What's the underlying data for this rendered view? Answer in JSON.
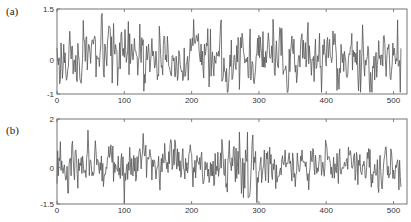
{
  "chart_data": [
    {
      "type": "line",
      "panel_label": "(a)",
      "title": "",
      "xlabel": "",
      "ylabel": "",
      "xlim": [
        0,
        520
      ],
      "ylim": [
        -1,
        1.5
      ],
      "xticks": [
        0,
        100,
        200,
        300,
        400,
        500
      ],
      "xtick_labels": [
        "0",
        "100",
        "200",
        "300",
        "400",
        "500"
      ],
      "yticks": [
        -1,
        0,
        1.5
      ],
      "ytick_labels": [
        "-1",
        "0",
        "1.5"
      ],
      "grid": false,
      "legend": null,
      "series": [
        {
          "name": "signal a",
          "n_points": 512,
          "color": "#555555",
          "description": "zero-mean noise-like trace, mostly within -0.6..1.0, occasional spikes to ~1.2 and dips to ~-0.8",
          "amplitude": 0.42,
          "seed": 17,
          "sample_values": {
            "x": [
              0,
              15,
              60,
              100,
              150,
              170,
              180,
              200,
              250,
              270,
              300,
              350,
              400,
              450,
              500
            ],
            "y": [
              0.1,
              0.9,
              -0.6,
              0.3,
              -0.5,
              1.1,
              -0.9,
              0.8,
              -0.5,
              -0.6,
              0.5,
              1.1,
              0.3,
              0.9,
              0.1
            ]
          }
        }
      ]
    },
    {
      "type": "line",
      "panel_label": "(b)",
      "title": "",
      "xlabel": "",
      "ylabel": "",
      "xlim": [
        0,
        520
      ],
      "ylim": [
        -1.5,
        2
      ],
      "xticks": [
        0,
        100,
        200,
        300,
        400,
        500
      ],
      "xtick_labels": [
        "0",
        "100",
        "200",
        "300",
        "400",
        "500"
      ],
      "yticks": [
        -1.5,
        0,
        2
      ],
      "ytick_labels": [
        "-1.5",
        "0",
        "2"
      ],
      "grid": false,
      "legend": null,
      "series": [
        {
          "name": "signal b",
          "n_points": 512,
          "color": "#555555",
          "description": "zero-mean noise-like trace, mostly within -0.8..1.0, burst around x≈270-290 reaching ~1.5 and ~-1.0",
          "amplitude": 0.45,
          "seed": 91,
          "burst_center": 280,
          "burst_gain": 2.2,
          "sample_values": {
            "x": [
              0,
              30,
              60,
              100,
              150,
              200,
              250,
              275,
              285,
              300,
              350,
              430,
              470,
              500
            ],
            "y": [
              0.2,
              1.2,
              -0.5,
              -0.2,
              0.3,
              0.8,
              0.3,
              1.5,
              -0.9,
              0.5,
              0.8,
              1.1,
              0.9,
              -0.7
            ]
          }
        }
      ]
    }
  ]
}
